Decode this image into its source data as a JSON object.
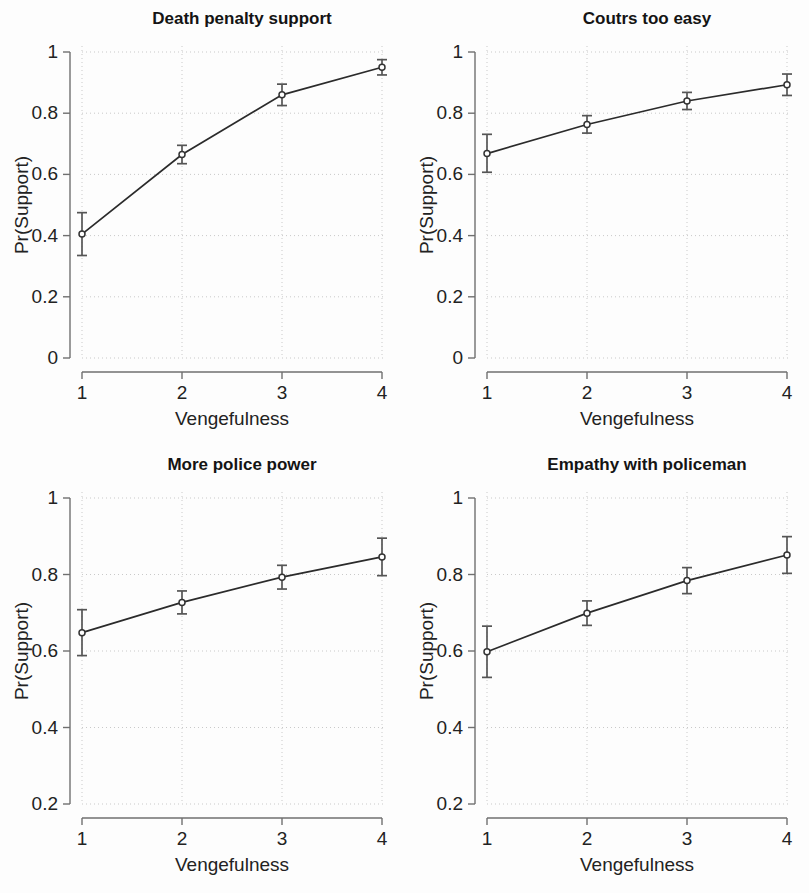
{
  "figure": {
    "background_color": "#fdfdfd",
    "line_color": "#2b2b2b",
    "error_color": "#555555",
    "grid_color": "#c9c9c9",
    "axis_color": "#6f6f6f",
    "rows": 2,
    "cols": 2
  },
  "chart_data": [
    {
      "type": "line",
      "title": "Death penalty support",
      "xlabel": "Vengefulness",
      "ylabel": "Pr(Support)",
      "x": [
        1,
        2,
        3,
        4
      ],
      "values": [
        0.405,
        0.665,
        0.86,
        0.95
      ],
      "err_low": [
        0.335,
        0.635,
        0.825,
        0.925
      ],
      "err_high": [
        0.475,
        0.695,
        0.895,
        0.975
      ],
      "xlim": [
        1,
        4
      ],
      "ylim": [
        0,
        1
      ],
      "xticks": [
        1,
        2,
        3,
        4
      ],
      "xticklabels": [
        "1",
        "2",
        "3",
        "4"
      ],
      "yticks": [
        0,
        0.2,
        0.4,
        0.6,
        0.8,
        1
      ],
      "yticklabels": [
        "0",
        "0.2",
        "0.4",
        "0.6",
        "0.8",
        "1"
      ],
      "grid": true,
      "legend": "none",
      "marker": "circle"
    },
    {
      "type": "line",
      "title": "Coutrs too easy",
      "xlabel": "Vengefulness",
      "ylabel": "Pr(Support)",
      "x": [
        1,
        2,
        3,
        4
      ],
      "values": [
        0.668,
        0.763,
        0.84,
        0.893
      ],
      "err_low": [
        0.607,
        0.735,
        0.812,
        0.858
      ],
      "err_high": [
        0.731,
        0.792,
        0.868,
        0.928
      ],
      "xlim": [
        1,
        4
      ],
      "ylim": [
        0,
        1
      ],
      "xticks": [
        1,
        2,
        3,
        4
      ],
      "xticklabels": [
        "1",
        "2",
        "3",
        "4"
      ],
      "yticks": [
        0,
        0.2,
        0.4,
        0.6,
        0.8,
        1
      ],
      "yticklabels": [
        "0",
        "0.2",
        "0.4",
        "0.6",
        "0.8",
        "1"
      ],
      "grid": true,
      "legend": "none",
      "marker": "circle"
    },
    {
      "type": "line",
      "title": "More police power",
      "xlabel": "Vengefulness",
      "ylabel": "Pr(Support)",
      "x": [
        1,
        2,
        3,
        4
      ],
      "values": [
        0.648,
        0.727,
        0.793,
        0.846
      ],
      "err_low": [
        0.588,
        0.697,
        0.762,
        0.797
      ],
      "err_high": [
        0.708,
        0.757,
        0.824,
        0.895
      ],
      "xlim": [
        1,
        4
      ],
      "ylim": [
        0.2,
        1
      ],
      "xticks": [
        1,
        2,
        3,
        4
      ],
      "xticklabels": [
        "1",
        "2",
        "3",
        "4"
      ],
      "yticks": [
        0.2,
        0.4,
        0.6,
        0.8,
        1
      ],
      "yticklabels": [
        "0.2",
        "0.4",
        "0.6",
        "0.8",
        "1"
      ],
      "grid": true,
      "legend": "none",
      "marker": "circle"
    },
    {
      "type": "line",
      "title": "Empathy with policeman",
      "xlabel": "Vengefulness",
      "ylabel": "Pr(Support)",
      "x": [
        1,
        2,
        3,
        4
      ],
      "values": [
        0.598,
        0.699,
        0.784,
        0.851
      ],
      "err_low": [
        0.531,
        0.667,
        0.75,
        0.803
      ],
      "err_high": [
        0.665,
        0.731,
        0.818,
        0.899
      ],
      "xlim": [
        1,
        4
      ],
      "ylim": [
        0.2,
        1
      ],
      "xticks": [
        1,
        2,
        3,
        4
      ],
      "xticklabels": [
        "1",
        "2",
        "3",
        "4"
      ],
      "yticks": [
        0.2,
        0.4,
        0.6,
        0.8,
        1
      ],
      "yticklabels": [
        "0.2",
        "0.4",
        "0.6",
        "0.8",
        "1"
      ],
      "grid": true,
      "legend": "none",
      "marker": "circle"
    }
  ]
}
